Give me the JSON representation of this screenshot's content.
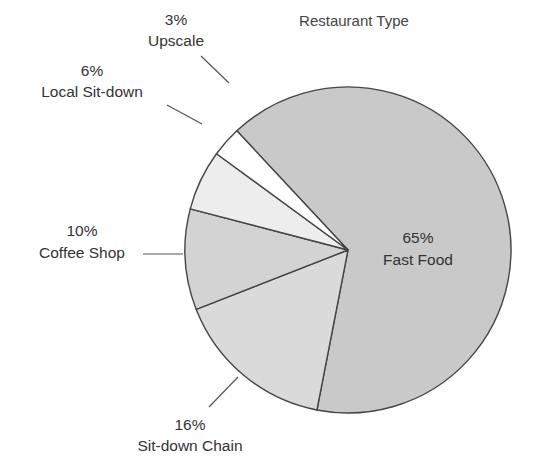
{
  "chart_data": {
    "type": "pie",
    "title": "Restaurant Type",
    "slices": [
      {
        "label": "Fast Food",
        "value": 65,
        "value_label": "65%",
        "color": "#c9c9c9"
      },
      {
        "label": "Sit-down Chain",
        "value": 16,
        "value_label": "16%",
        "color": "#dadada"
      },
      {
        "label": "Coffee Shop",
        "value": 10,
        "value_label": "10%",
        "color": "#d3d3d3"
      },
      {
        "label": "Local Sit-down",
        "value": 6,
        "value_label": "6%",
        "color": "#ededed"
      },
      {
        "label": "Upscale",
        "value": 3,
        "value_label": "3%",
        "color": "#ffffff"
      }
    ],
    "direction": "clockwise",
    "legend": "none",
    "labels": "outside with leader lines, Fast Food label inside"
  }
}
